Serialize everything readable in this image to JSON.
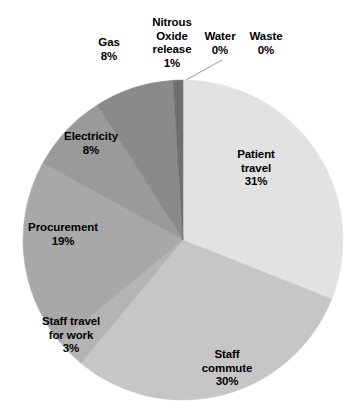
{
  "chart_data": {
    "type": "pie",
    "title": "",
    "subtitle": "",
    "xlabel": "",
    "ylabel": "",
    "legend": "none",
    "grid": false,
    "units": "percent",
    "start_angle_deg": 0,
    "direction": "clockwise",
    "categories": [
      "Water",
      "Waste",
      "Patient travel",
      "Staff commute",
      "Staff travel for work",
      "Procurement",
      "Electricity",
      "Gas",
      "Nitrous Oxide release"
    ],
    "values": [
      0,
      0,
      31,
      30,
      3,
      19,
      8,
      8,
      1
    ],
    "value_labels": [
      "0%",
      "0%",
      "31%",
      "30%",
      "3%",
      "19%",
      "8%",
      "8%",
      "1%"
    ],
    "colors": [
      "#f2f2f2",
      "#ededed",
      "#e2e2e2",
      "#c6c6c6",
      "#b4b4b4",
      "#a8a8a8",
      "#9a9a9a",
      "#8a8a8a",
      "#6f6f6f"
    ],
    "slices": [
      {
        "name": "Water",
        "value": 0,
        "label": "Water",
        "value_label": "0%",
        "color": "#f2f2f2"
      },
      {
        "name": "Waste",
        "value": 0,
        "label": "Waste",
        "value_label": "0%",
        "color": "#ededed"
      },
      {
        "name": "Patient travel",
        "value": 31,
        "label": "Patient travel",
        "value_label": "31%",
        "color": "#e2e2e2"
      },
      {
        "name": "Staff commute",
        "value": 30,
        "label": "Staff commute",
        "value_label": "30%",
        "color": "#c6c6c6"
      },
      {
        "name": "Staff travel for work",
        "value": 3,
        "label": "Staff travel for work",
        "value_label": "3%",
        "color": "#b4b4b4"
      },
      {
        "name": "Procurement",
        "value": 19,
        "label": "Procurement",
        "value_label": "19%",
        "color": "#a8a8a8"
      },
      {
        "name": "Electricity",
        "value": 8,
        "label": "Electricity",
        "value_label": "8%",
        "color": "#9a9a9a"
      },
      {
        "name": "Gas",
        "value": 8,
        "label": "Gas",
        "value_label": "8%",
        "color": "#8a8a8a"
      },
      {
        "name": "Nitrous Oxide release",
        "value": 1,
        "label": "Nitrous Oxide release",
        "value_label": "1%",
        "color": "#6f6f6f"
      }
    ]
  },
  "labels": {
    "gas": {
      "name": "Gas",
      "value": "8%"
    },
    "nitrous": {
      "line1": "Nitrous",
      "line2": "Oxide",
      "line3": "release",
      "value": "1%"
    },
    "water": {
      "name": "Water",
      "value": "0%"
    },
    "waste": {
      "name": "Waste",
      "value": "0%"
    },
    "electricity": {
      "name": "Electricity",
      "value": "8%"
    },
    "procurement": {
      "name": "Procurement",
      "value": "19%"
    },
    "staff_travel": {
      "line1": "Staff travel",
      "line2": "for work",
      "value": "3%"
    },
    "staff_commute": {
      "line1": "Staff",
      "line2": "commute",
      "value": "30%"
    },
    "patient_travel": {
      "line1": "Patient",
      "line2": "travel",
      "value": "31%"
    }
  }
}
